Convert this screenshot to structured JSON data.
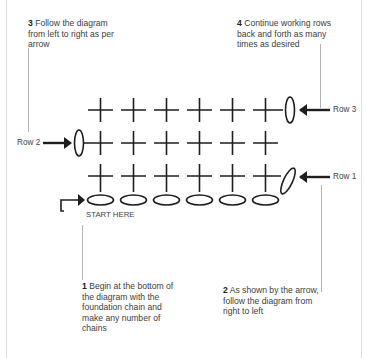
{
  "notes": [
    {
      "step": "1",
      "text": "Begin at the bottom of the diagram with the foundation chain and make any number of chains"
    },
    {
      "step": "2",
      "text": "As shown by the arrow, follow the diagram from right to left"
    },
    {
      "step": "3",
      "text": "Follow the diagram from left to right as per arrow"
    },
    {
      "step": "4",
      "text": "Continue working rows back and forth as many times as desired"
    }
  ],
  "labels": {
    "row1": "Row 1",
    "row2": "Row 2",
    "row3": "Row 3",
    "start": "START HERE"
  },
  "diagram": {
    "foundation_chains": 6,
    "rows": [
      {
        "name": "Row 1",
        "stitch": "single crochet",
        "count": 6,
        "direction": "right-to-left",
        "turning_chain_side": "right"
      },
      {
        "name": "Row 2",
        "stitch": "single crochet",
        "count": 6,
        "direction": "left-to-right",
        "turning_chain_side": "left"
      },
      {
        "name": "Row 3",
        "stitch": "single crochet",
        "count": 6,
        "direction": "right-to-left",
        "turning_chain_side": "right"
      }
    ],
    "symbols": {
      "chain": "oval",
      "single_crochet": "cross"
    },
    "stroke_color": "#1e1e1e",
    "leader_color": "#9a9a9a"
  }
}
